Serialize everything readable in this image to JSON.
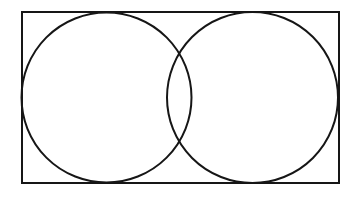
{
  "document": {
    "title": "Two Overlapping Circles Inscribed in a Rectangle",
    "kind": "geometric-line-diagram",
    "background_color": "#ffffff",
    "canvas": {
      "width": 360,
      "height": 199
    }
  },
  "style": {
    "stroke_color": "#161616",
    "fill_color": "none",
    "rectangle_stroke_width": 2.0,
    "circle_stroke_width": 2.0
  },
  "figure": {
    "rectangle": {
      "label": "bounding-rectangle",
      "x": 22,
      "y": 12,
      "width": 317,
      "height": 171,
      "left": 22,
      "top": 12,
      "right": 339,
      "bottom": 183
    },
    "circles": [
      {
        "label": "left-circle",
        "cx": 106.5,
        "cy": 97.5,
        "r": 85.0,
        "left": 21.5,
        "right": 191.5,
        "top": 12.5,
        "bottom": 182.5
      },
      {
        "label": "right-circle",
        "cx": 252.5,
        "cy": 97.5,
        "r": 85.5,
        "left": 167.0,
        "right": 338.0,
        "top": 12.0,
        "bottom": 183.0
      }
    ],
    "intersection_points": [
      {
        "label": "upper-intersection",
        "x": 180,
        "y": 52
      },
      {
        "label": "lower-intersection",
        "x": 180,
        "y": 145
      }
    ],
    "overlap_region": {
      "label": "lens-overlap",
      "left": 167.0,
      "right": 191.5,
      "top": 52,
      "bottom": 145
    }
  }
}
